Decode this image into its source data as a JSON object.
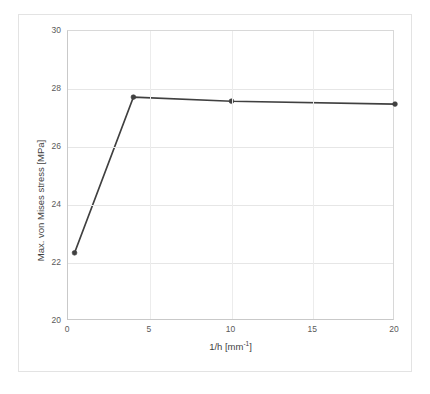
{
  "chart_data": {
    "type": "line",
    "title": "",
    "subtitle": "",
    "xlabel_text": "1/h [mm",
    "xlabel_sup": "-1",
    "xlabel_tail": "]",
    "xlabel": "1/h [mm-1]",
    "ylabel": "Max. von Mises stress [MPa]",
    "xlim": [
      0,
      20
    ],
    "ylim": [
      20,
      30
    ],
    "grid": true,
    "legend": null,
    "xticks": [
      0,
      5,
      10,
      15,
      20
    ],
    "xtick_labels": [
      "0",
      "5",
      "10",
      "15",
      "20"
    ],
    "yticks": [
      20,
      22,
      24,
      26,
      28,
      30
    ],
    "ytick_labels": [
      "20",
      "22",
      "24",
      "26",
      "28",
      "30"
    ],
    "series": [
      {
        "name": "Max. von Mises stress",
        "color": "#404040",
        "marker": "circle",
        "line_width": 1.6,
        "x": [
          0.4,
          4,
          10,
          20
        ],
        "y": [
          22.35,
          27.72,
          27.58,
          27.48
        ],
        "points": [
          {
            "x": 0.4,
            "y": 22.35
          },
          {
            "x": 4,
            "y": 27.72
          },
          {
            "x": 10,
            "y": 27.58
          },
          {
            "x": 20,
            "y": 27.48
          }
        ]
      }
    ]
  },
  "figure": {
    "background": "#ffffff",
    "frame_color": "#e3e3e3",
    "grid_color": "#e6e6e6",
    "axis_color": "#c9c9c9",
    "tick_text_color": "#5a5a5a",
    "axis_title_color": "#3f3f3f"
  }
}
